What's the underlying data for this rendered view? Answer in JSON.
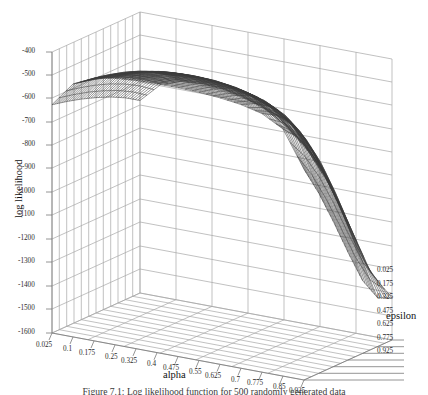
{
  "figure": {
    "caption": "Figure 7.1: Log likelihood function for 500 randomly generated data"
  },
  "chart_data": {
    "type": "surface",
    "title": "",
    "xlabel": "alpha",
    "ylabel": "epsilon",
    "zlabel": "log likelihood",
    "grid": true,
    "legend": "none",
    "projection": "3d-wireframe",
    "surface_color": "#3a3a3a",
    "grid_color": "#9b9b9b",
    "background_color": "#ffffff",
    "x": [
      0.025,
      0.1,
      0.175,
      0.25,
      0.325,
      0.4,
      0.475,
      0.55,
      0.625,
      0.7,
      0.775,
      0.85,
      0.925
    ],
    "x_tick_labels": [
      "0.025",
      "0.1",
      "0.175",
      "0.25",
      "0.325",
      "0.4",
      "0.475",
      "0.55",
      "0.625",
      "0.7",
      "0.775",
      "0.85",
      "0.925"
    ],
    "xlim": [
      0.025,
      0.925
    ],
    "x_step": 0.075,
    "y": [
      0.025,
      0.175,
      0.325,
      0.475,
      0.625,
      0.775,
      0.925
    ],
    "y_tick_labels": [
      "0.025",
      "0.175",
      "0.325",
      "0.475",
      "0.625",
      "0.775",
      "0.925"
    ],
    "ylim": [
      0.025,
      0.925
    ],
    "y_step": 0.15,
    "z_tick_labels": [
      "-400",
      "-500",
      "-600",
      "-700",
      "-800",
      "-900",
      "-1000",
      "-1100",
      "-1200",
      "-1300",
      "-1400",
      "-1500",
      "-1600"
    ],
    "z_ticks": [
      -400,
      -500,
      -600,
      -700,
      -800,
      -900,
      -1000,
      -1100,
      -1200,
      -1300,
      -1400,
      -1500,
      -1600
    ],
    "zlim": [
      -1600,
      -400
    ],
    "z_step": 100,
    "z_by_epsilon": [
      {
        "epsilon": 0.025,
        "values": [
          -625,
          -520,
          -478,
          -462,
          -455,
          -452,
          -452,
          -455,
          -462,
          -474,
          -496,
          -545,
          -700
        ]
      },
      {
        "epsilon": 0.175,
        "values": [
          -640,
          -534,
          -492,
          -475,
          -468,
          -465,
          -466,
          -470,
          -480,
          -498,
          -532,
          -610,
          -830
        ]
      },
      {
        "epsilon": 0.325,
        "values": [
          -658,
          -552,
          -510,
          -493,
          -486,
          -484,
          -487,
          -494,
          -510,
          -540,
          -596,
          -712,
          -980
        ]
      },
      {
        "epsilon": 0.475,
        "values": [
          -680,
          -576,
          -534,
          -518,
          -512,
          -512,
          -519,
          -533,
          -558,
          -604,
          -690,
          -846,
          -1140
        ]
      },
      {
        "epsilon": 0.625,
        "values": [
          -706,
          -606,
          -566,
          -552,
          -549,
          -553,
          -566,
          -590,
          -630,
          -700,
          -818,
          -1010,
          -1290
        ]
      },
      {
        "epsilon": 0.775,
        "values": [
          -738,
          -644,
          -608,
          -597,
          -598,
          -608,
          -630,
          -668,
          -728,
          -826,
          -975,
          -1185,
          -1390
        ]
      },
      {
        "epsilon": 0.925,
        "values": [
          -778,
          -692,
          -662,
          -657,
          -664,
          -684,
          -718,
          -775,
          -860,
          -985,
          -1150,
          -1330,
          -1420
        ]
      }
    ],
    "z_max": -452,
    "z_min": -1420
  },
  "axes": {
    "x_title": "alpha",
    "y_title": "epsilon",
    "z_title": "log likelihood"
  }
}
